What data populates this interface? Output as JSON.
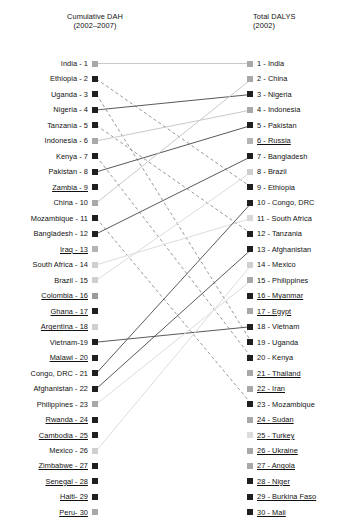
{
  "chart_data": {
    "type": "slopegraph",
    "title": "",
    "headers": {
      "left": "Cumulative DAH\n(2002–2007)",
      "right": "Total DALYS\n(2002)"
    },
    "left_axis_label": "Cumulative DAH (2002–2007)",
    "right_axis_label": "Total DALYS (2002)",
    "left_column": [
      {
        "rank": 1,
        "country": "India",
        "label": "India - 1",
        "shade": "#a8a8a8",
        "underlined": false
      },
      {
        "rank": 2,
        "country": "Ethiopia",
        "label": "Ethiopia - 2",
        "shade": "#1f1f1f",
        "underlined": false
      },
      {
        "rank": 3,
        "country": "Uganda",
        "label": "Uganda - 3",
        "shade": "#1f1f1f",
        "underlined": false
      },
      {
        "rank": 4,
        "country": "Nigeria",
        "label": "Nigeria - 4",
        "shade": "#1f1f1f",
        "underlined": false
      },
      {
        "rank": 5,
        "country": "Tanzania",
        "label": "Tanzania - 5",
        "shade": "#1f1f1f",
        "underlined": false
      },
      {
        "rank": 6,
        "country": "Indonesia",
        "label": "Indonesia - 6",
        "shade": "#a8a8a8",
        "underlined": false
      },
      {
        "rank": 7,
        "country": "Kenya",
        "label": "Kenya - 7",
        "shade": "#1f1f1f",
        "underlined": false
      },
      {
        "rank": 8,
        "country": "Pakistan",
        "label": "Pakistan - 8",
        "shade": "#1f1f1f",
        "underlined": false
      },
      {
        "rank": 9,
        "country": "Zambia",
        "label": "Zambia - 9",
        "shade": "#1f1f1f",
        "underlined": true
      },
      {
        "rank": 10,
        "country": "China",
        "label": "China - 10",
        "shade": "#a8a8a8",
        "underlined": false
      },
      {
        "rank": 11,
        "country": "Mozambique",
        "label": "Mozambique - 11",
        "shade": "#1f1f1f",
        "underlined": false
      },
      {
        "rank": 12,
        "country": "Bangladesh",
        "label": "Bangladesh - 12",
        "shade": "#1f1f1f",
        "underlined": false
      },
      {
        "rank": 13,
        "country": "Iraq",
        "label": "Iraq - 13",
        "shade": "#b4b4b4",
        "underlined": true
      },
      {
        "rank": 14,
        "country": "South Africa",
        "label": "South Africa - 14",
        "shade": "#cfcfcf",
        "underlined": false
      },
      {
        "rank": 15,
        "country": "Brazil",
        "label": "Brazil - 15",
        "shade": "#cfcfcf",
        "underlined": false
      },
      {
        "rank": 16,
        "country": "Colombia",
        "label": "Colombia - 16",
        "shade": "#9a9a9a",
        "underlined": true
      },
      {
        "rank": 17,
        "country": "Ghana",
        "label": "Ghana - 17",
        "shade": "#1f1f1f",
        "underlined": true
      },
      {
        "rank": 18,
        "country": "Argentina",
        "label": "Argentina - 18",
        "shade": "#cfcfcf",
        "underlined": true
      },
      {
        "rank": 19,
        "country": "Vietnam",
        "label": "Vietnam-19",
        "shade": "#1f1f1f",
        "underlined": false
      },
      {
        "rank": 20,
        "country": "Malawi",
        "label": "Malawi - 20",
        "shade": "#1f1f1f",
        "underlined": true
      },
      {
        "rank": 21,
        "country": "Congo, DRC",
        "label": "Congo, DRC - 21",
        "shade": "#1f1f1f",
        "underlined": false
      },
      {
        "rank": 22,
        "country": "Afghanistan",
        "label": "Afghanistan - 22",
        "shade": "#1f1f1f",
        "underlined": false
      },
      {
        "rank": 23,
        "country": "Philippines",
        "label": "Philippines - 23",
        "shade": "#a8a8a8",
        "underlined": false
      },
      {
        "rank": 24,
        "country": "Rwanda",
        "label": "Rwanda - 24",
        "shade": "#1f1f1f",
        "underlined": true
      },
      {
        "rank": 25,
        "country": "Cambodia",
        "label": "Cambodia - 25",
        "shade": "#1f1f1f",
        "underlined": true
      },
      {
        "rank": 26,
        "country": "Mexico",
        "label": "Mexico - 26",
        "shade": "#cfcfcf",
        "underlined": false
      },
      {
        "rank": 27,
        "country": "Zimbabwe",
        "label": "Zimbabwe - 27",
        "shade": "#1f1f1f",
        "underlined": true
      },
      {
        "rank": 28,
        "country": "Senegal",
        "label": "Senegal - 28",
        "shade": "#1f1f1f",
        "underlined": true
      },
      {
        "rank": 29,
        "country": "Haiti",
        "label": "Haiti- 29",
        "shade": "#1f1f1f",
        "underlined": true
      },
      {
        "rank": 30,
        "country": "Peru",
        "label": "Peru- 30",
        "shade": "#a8a8a8",
        "underlined": true
      }
    ],
    "right_column": [
      {
        "rank": 1,
        "country": "India",
        "label": "1 - India",
        "shade": "#a8a8a8",
        "underlined": false
      },
      {
        "rank": 2,
        "country": "China",
        "label": "2 - China",
        "shade": "#a8a8a8",
        "underlined": false
      },
      {
        "rank": 3,
        "country": "Nigeria",
        "label": "3 - Nigeria",
        "shade": "#1f1f1f",
        "underlined": false
      },
      {
        "rank": 4,
        "country": "Indonesia",
        "label": "4 - Indonesia",
        "shade": "#a8a8a8",
        "underlined": false
      },
      {
        "rank": 5,
        "country": "Pakistan",
        "label": "5 - Pakistan",
        "shade": "#1f1f1f",
        "underlined": false
      },
      {
        "rank": 6,
        "country": "Russia",
        "label": "6 - Russia",
        "shade": "#b4b4b4",
        "underlined": true
      },
      {
        "rank": 7,
        "country": "Bangladesh",
        "label": "7 - Bangladesh",
        "shade": "#1f1f1f",
        "underlined": false
      },
      {
        "rank": 8,
        "country": "Brazil",
        "label": "8 - Brazil",
        "shade": "#cfcfcf",
        "underlined": false
      },
      {
        "rank": 9,
        "country": "Ethiopia",
        "label": "9 - Ethiopia",
        "shade": "#1f1f1f",
        "underlined": false
      },
      {
        "rank": 10,
        "country": "Congo, DRC",
        "label": "10 - Congo, DRC",
        "shade": "#1f1f1f",
        "underlined": false
      },
      {
        "rank": 11,
        "country": "South Africa",
        "label": "11 - South Africa",
        "shade": "#d8d8d8",
        "underlined": false
      },
      {
        "rank": 12,
        "country": "Tanzania",
        "label": "12 - Tanzania",
        "shade": "#1f1f1f",
        "underlined": false
      },
      {
        "rank": 13,
        "country": "Afghanistan",
        "label": "13 - Afghanistan",
        "shade": "#1f1f1f",
        "underlined": false
      },
      {
        "rank": 14,
        "country": "Mexico",
        "label": "14 - Mexico",
        "shade": "#cfcfcf",
        "underlined": false
      },
      {
        "rank": 15,
        "country": "Philippines",
        "label": "15 - Philippines",
        "shade": "#a8a8a8",
        "underlined": false
      },
      {
        "rank": 16,
        "country": "Myanmar",
        "label": "16 - Myanmar",
        "shade": "#1f1f1f",
        "underlined": true
      },
      {
        "rank": 17,
        "country": "Egypt",
        "label": "17 - Egypt",
        "shade": "#a8a8a8",
        "underlined": true
      },
      {
        "rank": 18,
        "country": "Vietnam",
        "label": "18 - Vietnam",
        "shade": "#1f1f1f",
        "underlined": false
      },
      {
        "rank": 19,
        "country": "Uganda",
        "label": "19 - Uganda",
        "shade": "#1f1f1f",
        "underlined": false
      },
      {
        "rank": 20,
        "country": "Kenya",
        "label": "20 - Kenya",
        "shade": "#1f1f1f",
        "underlined": false
      },
      {
        "rank": 21,
        "country": "Thailand",
        "label": "21 - Thailand",
        "shade": "#a8a8a8",
        "underlined": true
      },
      {
        "rank": 22,
        "country": "Iran",
        "label": "22 - Iran",
        "shade": "#a8a8a8",
        "underlined": true
      },
      {
        "rank": 23,
        "country": "Mozambique",
        "label": "23 - Mozambique",
        "shade": "#1f1f1f",
        "underlined": false
      },
      {
        "rank": 24,
        "country": "Sudan",
        "label": "24 - Sudan",
        "shade": "#a8a8a8",
        "underlined": true
      },
      {
        "rank": 25,
        "country": "Turkey",
        "label": "25 - Turkey",
        "shade": "#dcdcdc",
        "underlined": true
      },
      {
        "rank": 26,
        "country": "Ukraine",
        "label": "26 - Ukraine",
        "shade": "#a8a8a8",
        "underlined": true
      },
      {
        "rank": 27,
        "country": "Angola",
        "label": "27 - Angola",
        "shade": "#a8a8a8",
        "underlined": true
      },
      {
        "rank": 28,
        "country": "Niger",
        "label": "28 - Niger",
        "shade": "#1f1f1f",
        "underlined": true
      },
      {
        "rank": 29,
        "country": "Burkina Faso",
        "label": "29 - Burkina Faso",
        "shade": "#1f1f1f",
        "underlined": true
      },
      {
        "rank": 30,
        "country": "Mali",
        "label": "30 - Mali",
        "shade": "#1f1f1f",
        "underlined": true
      }
    ],
    "links": [
      {
        "country": "India",
        "from": 1,
        "to": 1,
        "style": "solid",
        "color": "#c9c9c9"
      },
      {
        "country": "Ethiopia",
        "from": 2,
        "to": 9,
        "style": "dashed",
        "color": "#8c8c8c"
      },
      {
        "country": "Uganda",
        "from": 3,
        "to": 19,
        "style": "dashed",
        "color": "#8c8c8c"
      },
      {
        "country": "Nigeria",
        "from": 4,
        "to": 3,
        "style": "solid",
        "color": "#5a5a5a"
      },
      {
        "country": "Tanzania",
        "from": 5,
        "to": 12,
        "style": "dashed",
        "color": "#8c8c8c"
      },
      {
        "country": "Indonesia",
        "from": 6,
        "to": 4,
        "style": "solid",
        "color": "#c9c9c9"
      },
      {
        "country": "Kenya",
        "from": 7,
        "to": 20,
        "style": "dashed",
        "color": "#8c8c8c"
      },
      {
        "country": "Pakistan",
        "from": 8,
        "to": 5,
        "style": "solid",
        "color": "#5a5a5a"
      },
      {
        "country": "China",
        "from": 10,
        "to": 2,
        "style": "solid",
        "color": "#c9c9c9"
      },
      {
        "country": "Mozambique",
        "from": 11,
        "to": 23,
        "style": "dashed",
        "color": "#8c8c8c"
      },
      {
        "country": "Bangladesh",
        "from": 12,
        "to": 7,
        "style": "solid",
        "color": "#5a5a5a"
      },
      {
        "country": "South Africa",
        "from": 14,
        "to": 11,
        "style": "solid",
        "color": "#dcdcdc"
      },
      {
        "country": "Brazil",
        "from": 15,
        "to": 8,
        "style": "solid",
        "color": "#dcdcdc"
      },
      {
        "country": "Vietnam",
        "from": 19,
        "to": 18,
        "style": "solid",
        "color": "#5a5a5a"
      },
      {
        "country": "Congo, DRC",
        "from": 21,
        "to": 10,
        "style": "solid",
        "color": "#5a5a5a"
      },
      {
        "country": "Afghanistan",
        "from": 22,
        "to": 13,
        "style": "solid",
        "color": "#5a5a5a"
      },
      {
        "country": "Philippines",
        "from": 23,
        "to": 15,
        "style": "solid",
        "color": "#dcdcdc"
      },
      {
        "country": "Mexico",
        "from": 26,
        "to": 14,
        "style": "solid",
        "color": "#dcdcdc"
      }
    ]
  },
  "caption": ""
}
